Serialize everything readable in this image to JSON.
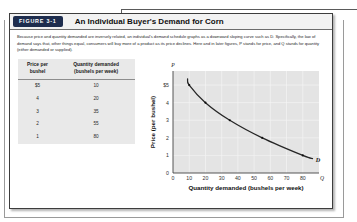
{
  "figure": {
    "tag": "FIGURE 3-1",
    "title": "An Individual Buyer's Demand for Corn",
    "caption_line1": "Because price and quantity demanded are inversely related, an individual's demand schedule graphs as a downward sloping curve such as D.",
    "caption_line2": "Specifically, the law of demand says that, other things equal, consumers will buy more of a product as its price declines. Here and in later figures,",
    "caption_line3": "P stands for price, and Q stands for quantity (either demanded or supplied)."
  },
  "table": {
    "header_price_l1": "Price per",
    "header_price_l2": "bushel",
    "header_qty_l1": "Quantity demanded",
    "header_qty_l2": "(bushels per week)",
    "rows": [
      {
        "price": "$5",
        "quantity": "10"
      },
      {
        "price": "4",
        "quantity": "20"
      },
      {
        "price": "3",
        "quantity": "35"
      },
      {
        "price": "2",
        "quantity": "55"
      },
      {
        "price": "1",
        "quantity": "80"
      }
    ]
  },
  "chart_data": {
    "type": "line",
    "title": "",
    "xlabel": "Quantity demanded (bushels per week)",
    "ylabel": "Price (per bushel)",
    "x": [
      10,
      20,
      35,
      55,
      80
    ],
    "values": [
      5,
      4,
      3,
      2,
      1
    ],
    "series": [
      {
        "name": "D",
        "x": [
          10,
          20,
          35,
          55,
          80
        ],
        "values": [
          5,
          4,
          3,
          2,
          1
        ]
      }
    ],
    "xlim": [
      0,
      90
    ],
    "ylim": [
      0,
      5.8
    ],
    "xticks": [
      "0",
      "10",
      "20",
      "30",
      "40",
      "50",
      "60",
      "70",
      "80"
    ],
    "yticks": [
      "0",
      "1",
      "2",
      "3",
      "4",
      "$5"
    ],
    "x_axis_symbol": "Q",
    "y_axis_symbol": "P",
    "curve_label": "D",
    "grid": true,
    "legend": "none",
    "plot_bg": "#e4e4e4",
    "curve_color": "#262626",
    "marker_color": "#111111"
  }
}
